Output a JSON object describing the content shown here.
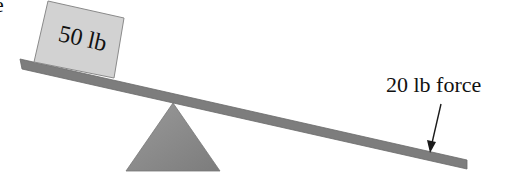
{
  "diagram": {
    "type": "lever",
    "box": {
      "label": "50 lb"
    },
    "force": {
      "label": "20 lb force"
    },
    "corner_glyph": "e",
    "colors": {
      "background": "#ffffff",
      "plank": "#7d7d7d",
      "plank_edge": "#6a6a6a",
      "box_fill": "#d2d2d2",
      "box_edge": "#8a8a8a",
      "fulcrum": "#8a8a8a",
      "fulcrum_edge": "#777777",
      "arrow": "#1a1a1a",
      "text": "#111111"
    }
  }
}
